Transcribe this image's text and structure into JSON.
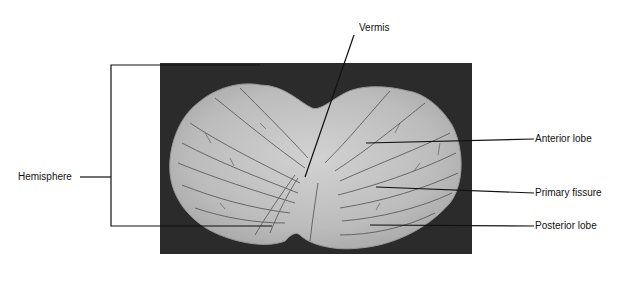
{
  "figure": {
    "caption": "(a)",
    "colors": {
      "background": "#ffffff",
      "photo_background": "#2b2b2b",
      "tissue": "#bdbdbd",
      "tissue_highlight": "#d6d6d6",
      "sulci": "#3a3a3a",
      "leader_lines": "#111111"
    },
    "labels": {
      "vermis": "Vermis",
      "hemisphere": "Hemisphere",
      "anterior_lobe": "Anterior lobe",
      "primary_fissure": "Primary fissure",
      "posterior_lobe": "Posterior lobe"
    }
  }
}
